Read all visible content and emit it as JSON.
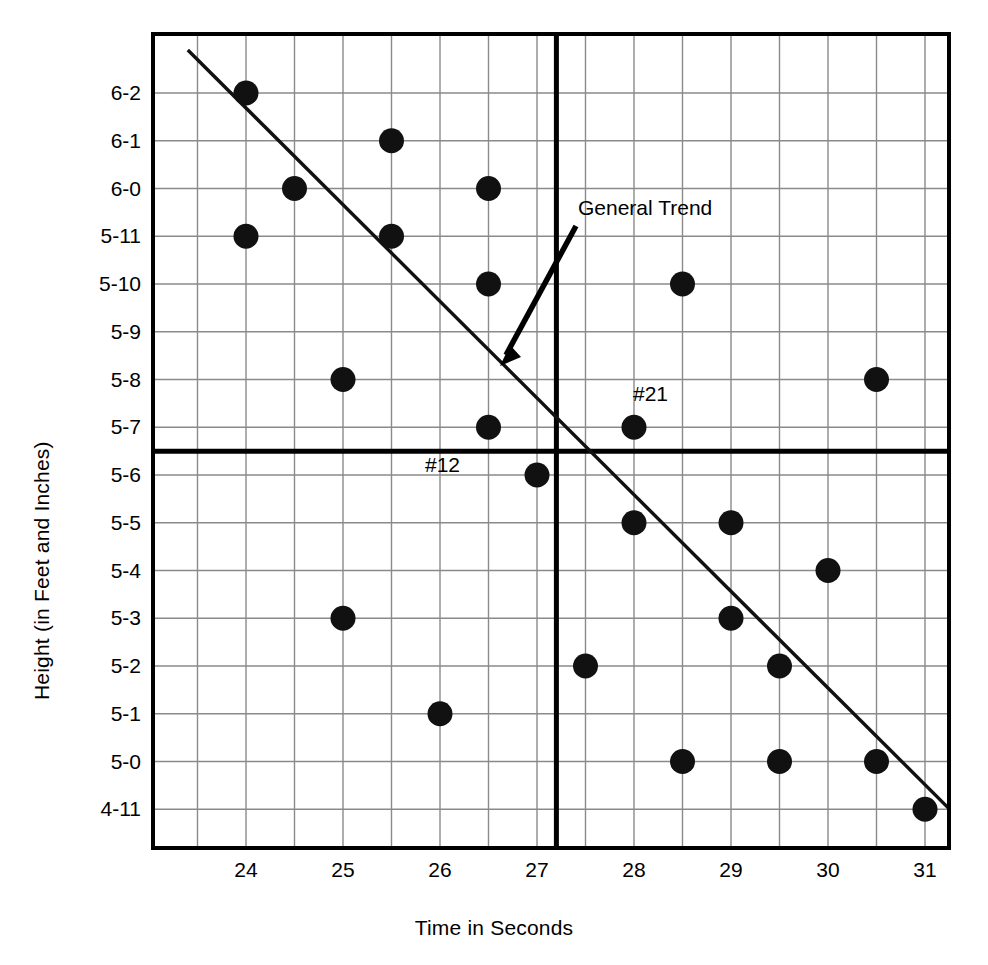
{
  "chart_data": {
    "type": "scatter",
    "title": "",
    "xlabel": "Time in Seconds",
    "ylabel": "Height (in Feet and Inches)",
    "xlim": [
      23.3,
      31.6
    ],
    "ylim_index": [
      -0.7,
      16.2
    ],
    "grid": true,
    "legend": "none",
    "x_ticks": [
      "24",
      "25",
      "26",
      "27",
      "28",
      "29",
      "30",
      "31"
    ],
    "x_tick_values": [
      24,
      25,
      26,
      27,
      28,
      29,
      30,
      31
    ],
    "x_minor_step": 0.5,
    "y_ticks": [
      "6-2",
      "6-1",
      "6-0",
      "5-11",
      "5-10",
      "5-9",
      "5-8",
      "5-7",
      "5-6",
      "5-5",
      "5-4",
      "5-3",
      "5-2",
      "5-1",
      "5-0",
      "4-11"
    ],
    "y_tick_inches": [
      74,
      73,
      72,
      71,
      70,
      69,
      68,
      67,
      66,
      65,
      64,
      63,
      62,
      61,
      60,
      59
    ],
    "points": [
      {
        "x": 24.0,
        "y": "6-2",
        "y_in": 74
      },
      {
        "x": 24.0,
        "y": "5-11",
        "y_in": 71
      },
      {
        "x": 24.5,
        "y": "6-0",
        "y_in": 72
      },
      {
        "x": 25.0,
        "y": "5-8",
        "y_in": 68
      },
      {
        "x": 25.0,
        "y": "5-3",
        "y_in": 63
      },
      {
        "x": 25.5,
        "y": "6-1",
        "y_in": 73
      },
      {
        "x": 25.5,
        "y": "5-11",
        "y_in": 71
      },
      {
        "x": 26.0,
        "y": "5-1",
        "y_in": 61
      },
      {
        "x": 26.5,
        "y": "6-0",
        "y_in": 72
      },
      {
        "x": 26.5,
        "y": "5-10",
        "y_in": 70
      },
      {
        "x": 26.5,
        "y": "5-7",
        "y_in": 67
      },
      {
        "x": 27.0,
        "y": "5-6",
        "y_in": 66,
        "label": "#12"
      },
      {
        "x": 27.5,
        "y": "5-2",
        "y_in": 62
      },
      {
        "x": 28.0,
        "y": "5-7",
        "y_in": 67,
        "label": "#21"
      },
      {
        "x": 28.0,
        "y": "5-5",
        "y_in": 65
      },
      {
        "x": 28.5,
        "y": "5-10",
        "y_in": 70
      },
      {
        "x": 28.5,
        "y": "5-0",
        "y_in": 60
      },
      {
        "x": 29.0,
        "y": "5-5",
        "y_in": 65
      },
      {
        "x": 29.0,
        "y": "5-3",
        "y_in": 63
      },
      {
        "x": 29.5,
        "y": "5-2",
        "y_in": 62
      },
      {
        "x": 29.5,
        "y": "5-0",
        "y_in": 60
      },
      {
        "x": 30.0,
        "y": "5-4",
        "y_in": 64
      },
      {
        "x": 30.5,
        "y": "5-8",
        "y_in": 68
      },
      {
        "x": 30.5,
        "y": "5-0",
        "y_in": 60
      },
      {
        "x": 31.0,
        "y": "4-11",
        "y_in": 59
      }
    ],
    "trend_line": {
      "label": "General Trend",
      "from": {
        "x": 23.4,
        "y_in": 74.9
      },
      "to": {
        "x": 31.6,
        "y_in": 58.3
      }
    },
    "reference_lines": [
      {
        "orientation": "vertical",
        "x": 27.2,
        "style": "bold"
      },
      {
        "orientation": "horizontal",
        "y_in": 66.5,
        "style": "bold"
      }
    ],
    "annotations": [
      {
        "text": "General Trend",
        "kind": "arrow-callout"
      },
      {
        "text": "#21",
        "kind": "point-label"
      },
      {
        "text": "#12",
        "kind": "point-label"
      }
    ],
    "colors": {
      "marker": "#111111",
      "grid": "#8a8a8a",
      "axis": "#000000",
      "trend": "#111111",
      "background": "#ffffff"
    }
  }
}
